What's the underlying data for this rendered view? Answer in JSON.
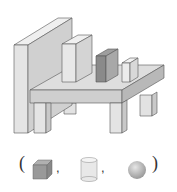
{
  "scene": {
    "description": "3D block structure: tall wall, table with legs, boxes on top",
    "colors": {
      "light": "#e6e6e6",
      "mid": "#d2d2d2",
      "dark": "#b8b8b8",
      "box_dark_front": "#8a8a8a",
      "box_dark_side": "#a8a8a8",
      "outline": "#555555"
    }
  },
  "answer_row": {
    "open_paren": "(",
    "close_paren": ")",
    "separator": ",",
    "options": [
      "cube-icon",
      "cylinder-icon",
      "sphere-icon"
    ]
  }
}
